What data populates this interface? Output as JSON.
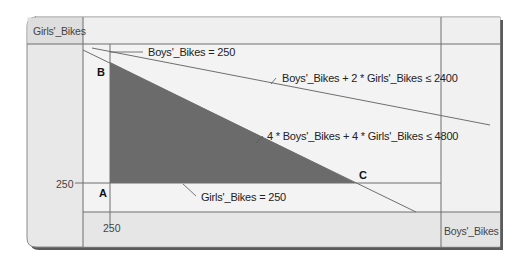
{
  "diagram": {
    "type": "feasible-region-graph",
    "y_axis_label": "Girls'_Bikes",
    "x_axis_label": "Boys'_Bikes",
    "ticks": {
      "x_tick": "250",
      "y_tick": "250"
    },
    "points": {
      "A": "A",
      "B": "B",
      "C": "C"
    },
    "constraints": [
      {
        "id": "boys-min",
        "label": "Boys'_Bikes = 250"
      },
      {
        "id": "assembly",
        "label": "Boys'_Bikes + 2 * Girls'_Bikes ≤ 2400"
      },
      {
        "id": "labor",
        "label": "4 * Boys'_Bikes + 4 * Girls'_Bikes ≤ 4800"
      },
      {
        "id": "girls-min",
        "label": "Girls'_Bikes = 250"
      }
    ],
    "colors": {
      "background": "#ebebeb",
      "plot_area": "#f3f3f3",
      "feasible_region": "#6b6b6b",
      "lines": "#6e6e6e",
      "frame_shadow": "#555555"
    }
  }
}
